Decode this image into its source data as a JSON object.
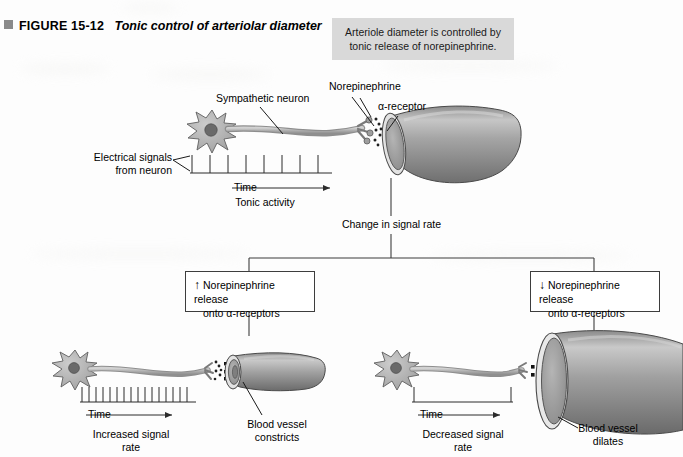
{
  "figure": {
    "marker_icon": "filled-square-icon",
    "number": "FIGURE 15-12",
    "title": "Tonic control of arteriolar diameter"
  },
  "callout": {
    "line1": "Arteriole diameter is controlled by",
    "line2": "tonic release of norepinephrine.",
    "background": "#d9d9d9"
  },
  "top_panel": {
    "labels": {
      "sympathetic_neuron": "Sympathetic neuron",
      "norepinephrine": "Norepinephrine",
      "alpha_receptor": "α-receptor",
      "electrical_signals_l1": "Electrical signals",
      "electrical_signals_l2": "from neuron",
      "time": "Time",
      "tonic_activity": "Tonic activity"
    },
    "spike_count": 8
  },
  "flow": {
    "change_in_signal_rate": "Change in signal rate"
  },
  "left_branch": {
    "box": {
      "arrow": "↑",
      "line1": "Norepinephrine release",
      "line2": "onto α-receptors"
    },
    "labels": {
      "time": "Time",
      "rate_l1": "Increased signal",
      "rate_l2": "rate",
      "vessel_l1": "Blood vessel",
      "vessel_l2": "constricts"
    },
    "spike_count": 16
  },
  "right_branch": {
    "box": {
      "arrow": "↓",
      "line1": "Norepinephrine release",
      "line2": "onto α-receptors"
    },
    "labels": {
      "time": "Time",
      "rate_l1": "Decreased signal",
      "rate_l2": "rate",
      "vessel_l1": "Blood vessel",
      "vessel_l2": "dilates"
    },
    "spike_count": 2
  },
  "colors": {
    "vessel_light": "#cfcfcf",
    "vessel_mid": "#9a9a9a",
    "vessel_dark": "#6e6e6e",
    "neuron_fill": "#b3b3b3",
    "nucleus": "#6a6a6a",
    "outline": "#3a3a3a"
  }
}
